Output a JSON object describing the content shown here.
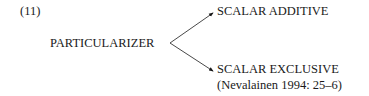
{
  "example_number": "(11)",
  "root": {
    "label": "PARTICULARIZER"
  },
  "branches": [
    {
      "label": "SCALAR ADDITIVE"
    },
    {
      "label": "SCALAR EXCLUSIVE"
    }
  ],
  "citation": "(Nevalainen 1994: 25–6)"
}
